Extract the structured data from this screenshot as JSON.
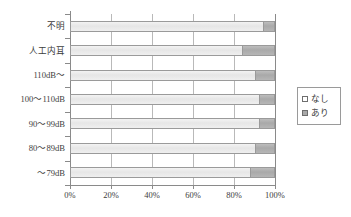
{
  "chart_data": {
    "type": "bar",
    "orientation": "horizontal",
    "stacked": "100%",
    "title": "",
    "xlabel": "",
    "ylabel": "",
    "xlim": [
      0,
      100
    ],
    "grid": true,
    "legend_position": "right",
    "categories": [
      "不明",
      "人工内耳",
      "110dB～",
      "100～110dB",
      "90～99dB",
      "80～89dB",
      "～79dB"
    ],
    "xticklabels": [
      "0%",
      "20%",
      "40%",
      "60%",
      "80%",
      "100%"
    ],
    "xtickvalues": [
      0,
      20,
      40,
      60,
      80,
      100
    ],
    "series": [
      {
        "name": "なし",
        "color": "#ebebeb",
        "values": [
          94,
          84,
          90,
          92,
          92,
          90,
          88
        ]
      },
      {
        "name": "あり",
        "color": "#a9a9a9",
        "values": [
          6,
          16,
          10,
          8,
          8,
          10,
          12
        ]
      }
    ]
  },
  "legend": {
    "items": [
      {
        "label": "なし",
        "marker": "empty-square-icon"
      },
      {
        "label": "あり",
        "marker": "filled-square-icon"
      }
    ]
  }
}
